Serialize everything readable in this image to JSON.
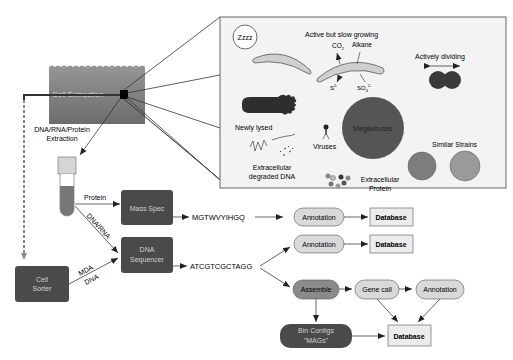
{
  "environment": {
    "cell_extraction_label": "Cell Extraction",
    "extraction_label_line1": "DNA/RNA/Protein",
    "extraction_label_line2": "Extraction"
  },
  "inset": {
    "dormant_label": "Zzzz",
    "o2_label": "O",
    "o2_sub": "2",
    "slow_growing_label": "Active but slow growing",
    "co2_label": "CO",
    "co2_sub": "2",
    "alkane_label": "Alkane",
    "sulfide_label": "S",
    "sulfide_sup": "2-",
    "sulfate_label": "SO",
    "sulfate_sub": "4",
    "sulfate_sup": "2-",
    "dividing_label": "Actively dividing",
    "lysed_label": "Newly lysed",
    "megaviruses_label": "Megaviruses",
    "viruses_label": "Viruses",
    "similar_strains_label": "Similar Strains",
    "degraded_dna_line1": "Extracellular",
    "degraded_dna_line2": "degraded DNA",
    "ext_protein_line1": "Extracellular",
    "ext_protein_line2": "Protein"
  },
  "workflow": {
    "protein_label": "Protein",
    "dna_rna_label": "DNA/RNA",
    "mda_label": "MDA",
    "dna_label": "DNA",
    "mass_spec": "Mass Spec",
    "dna_sequencer_line1": "DNA",
    "dna_sequencer_line2": "Sequencer",
    "cell_sorter_line1": "Cell",
    "cell_sorter_line2": "Sorter",
    "protein_seq": "MGTWVYIHGQ",
    "dna_seq": "ATCGTCGCTAGG",
    "annotation": "Annotation",
    "database": "Database",
    "assemble": "Assemble",
    "gene_call": "Gene call",
    "bin_contigs_line1": "Bin Contigs",
    "bin_contigs_line2": "\"MAGs\""
  },
  "colors": {
    "dark_box": "#4a4a4a",
    "light_box": "#d9d9d9",
    "water_top": "#8e8e8e",
    "water_bottom": "#6e6e6e",
    "cell_dark": "#3a3a3a",
    "virus_mega": "#555555",
    "strain_gray": "#8a8a8a"
  }
}
